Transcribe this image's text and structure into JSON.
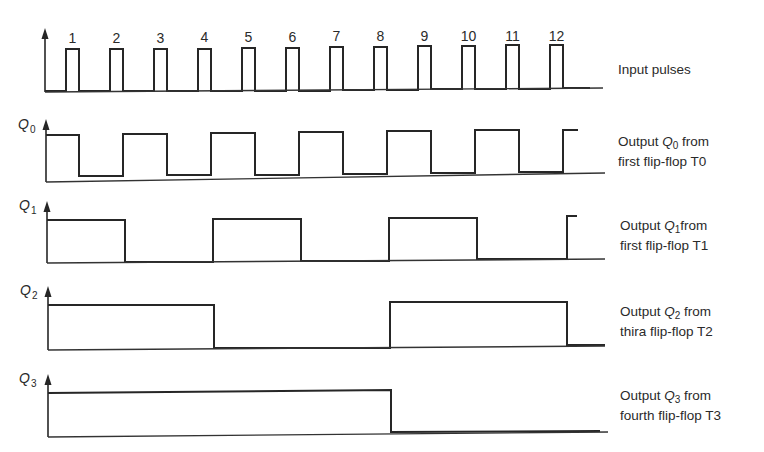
{
  "caption": "(a) Timing diagram",
  "chart_data": {
    "type": "timing-diagram",
    "pulse_labels": [
      "1",
      "2",
      "3",
      "4",
      "5",
      "6",
      "7",
      "8",
      "9",
      "10",
      "11",
      "12"
    ],
    "signals": [
      {
        "name": "Input pulses",
        "values_per_pulse_period": "pulse train of 12 clock pulses"
      },
      {
        "name": "Q0",
        "states_after_each_pulse": [
          1,
          0,
          1,
          0,
          1,
          0,
          1,
          0,
          1,
          0,
          1,
          0,
          1
        ]
      },
      {
        "name": "Q1",
        "states_after_each_pulse": [
          1,
          1,
          0,
          0,
          1,
          1,
          0,
          0,
          1,
          1,
          0,
          0,
          1
        ]
      },
      {
        "name": "Q2",
        "states_after_each_pulse": [
          1,
          1,
          1,
          1,
          0,
          0,
          0,
          0,
          1,
          1,
          1,
          1,
          0
        ]
      },
      {
        "name": "Q3",
        "states_after_each_pulse": [
          1,
          1,
          1,
          1,
          1,
          1,
          1,
          1,
          0,
          0,
          0,
          0,
          0
        ]
      }
    ]
  },
  "rows": [
    {
      "id": "input",
      "signal": "",
      "subscript": "",
      "label_line1": "Input pulses",
      "label_line2": ""
    },
    {
      "id": "q0",
      "signal": "Q",
      "subscript": "0",
      "label_pre": "Output ",
      "label_sig": "Q",
      "label_sub": "0",
      "label_post": " from",
      "label_line2": "first flip-flop T0"
    },
    {
      "id": "q1",
      "signal": "Q",
      "subscript": "1",
      "label_pre": "Output ",
      "label_sig": "Q",
      "label_sub": "1",
      "label_post": "from",
      "label_line2": "first flip-flop T1"
    },
    {
      "id": "q2",
      "signal": "Q",
      "subscript": "2",
      "label_pre": "Output ",
      "label_sig": "Q",
      "label_sub": "2",
      "label_post": " from",
      "label_line2": "thira flip-flop T2"
    },
    {
      "id": "q3",
      "signal": "Q",
      "subscript": "3",
      "label_pre": "Output ",
      "label_sig": "Q",
      "label_sub": "3",
      "label_post": " from",
      "label_line2": "fourth flip-flop T3"
    }
  ]
}
